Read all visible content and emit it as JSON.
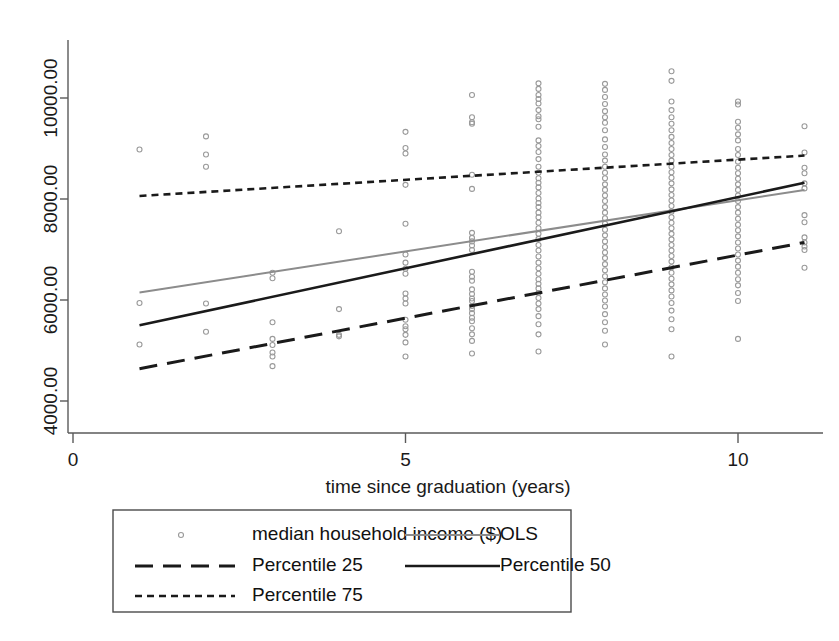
{
  "chart_data": {
    "type": "scatter",
    "title": "",
    "xlabel": "time since graduation (years)",
    "ylabel": "",
    "xlim": [
      0,
      11.6
    ],
    "ylim": [
      3650,
      10650
    ],
    "xticks": [
      0,
      5,
      10
    ],
    "xticklabels": [
      "0",
      "5",
      "10"
    ],
    "yticks": [
      4000,
      6000,
      8000,
      10000
    ],
    "yticklabels": [
      "4000.00",
      "6000.00",
      "8000.00",
      "10000.00"
    ],
    "grid": false,
    "legend_position": "below-axes",
    "marker": {
      "shape": "open-circle",
      "color": "#9a9a9a",
      "size": 5
    },
    "series": [
      {
        "name": "median household income ($)",
        "type": "scatter",
        "color": "#9a9a9a",
        "points": [
          [
            1,
            8980
          ],
          [
            1,
            5940
          ],
          [
            1,
            5120
          ],
          [
            2,
            9240
          ],
          [
            2,
            8880
          ],
          [
            2,
            8640
          ],
          [
            2,
            5930
          ],
          [
            2,
            5370
          ],
          [
            3,
            6540
          ],
          [
            3,
            6430
          ],
          [
            3,
            5560
          ],
          [
            3,
            5230
          ],
          [
            3,
            5110
          ],
          [
            3,
            4960
          ],
          [
            3,
            4880
          ],
          [
            3,
            4690
          ],
          [
            4,
            7360
          ],
          [
            4,
            5820
          ],
          [
            4,
            5310
          ],
          [
            4,
            5280
          ],
          [
            5,
            9330
          ],
          [
            5,
            9010
          ],
          [
            5,
            8900
          ],
          [
            5,
            8280
          ],
          [
            5,
            7510
          ],
          [
            5,
            6900
          ],
          [
            5,
            6740
          ],
          [
            5,
            6620
          ],
          [
            5,
            6520
          ],
          [
            5,
            6130
          ],
          [
            5,
            6030
          ],
          [
            5,
            5930
          ],
          [
            5,
            5610
          ],
          [
            5,
            5480
          ],
          [
            5,
            5420
          ],
          [
            5,
            5310
          ],
          [
            5,
            5160
          ],
          [
            5,
            4880
          ],
          [
            6,
            10060
          ],
          [
            6,
            9620
          ],
          [
            6,
            9520
          ],
          [
            6,
            9490
          ],
          [
            6,
            8480
          ],
          [
            6,
            8200
          ],
          [
            6,
            7330
          ],
          [
            6,
            7230
          ],
          [
            6,
            7160
          ],
          [
            6,
            7080
          ],
          [
            6,
            6990
          ],
          [
            6,
            6560
          ],
          [
            6,
            6460
          ],
          [
            6,
            6380
          ],
          [
            6,
            6210
          ],
          [
            6,
            6120
          ],
          [
            6,
            6030
          ],
          [
            6,
            5980
          ],
          [
            6,
            5880
          ],
          [
            6,
            5820
          ],
          [
            6,
            5740
          ],
          [
            6,
            5650
          ],
          [
            6,
            5580
          ],
          [
            6,
            5440
          ],
          [
            6,
            5320
          ],
          [
            6,
            5190
          ],
          [
            6,
            4940
          ],
          [
            7,
            10290
          ],
          [
            7,
            10180
          ],
          [
            7,
            10060
          ],
          [
            7,
            9980
          ],
          [
            7,
            9890
          ],
          [
            7,
            9760
          ],
          [
            7,
            9640
          ],
          [
            7,
            9580
          ],
          [
            7,
            9430
          ],
          [
            7,
            9160
          ],
          [
            7,
            9050
          ],
          [
            7,
            8930
          ],
          [
            7,
            8790
          ],
          [
            7,
            8640
          ],
          [
            7,
            8520
          ],
          [
            7,
            8410
          ],
          [
            7,
            8320
          ],
          [
            7,
            8230
          ],
          [
            7,
            8120
          ],
          [
            7,
            8010
          ],
          [
            7,
            7920
          ],
          [
            7,
            7840
          ],
          [
            7,
            7730
          ],
          [
            7,
            7640
          ],
          [
            7,
            7530
          ],
          [
            7,
            7420
          ],
          [
            7,
            7310
          ],
          [
            7,
            7210
          ],
          [
            7,
            7090
          ],
          [
            7,
            6980
          ],
          [
            7,
            6860
          ],
          [
            7,
            6740
          ],
          [
            7,
            6630
          ],
          [
            7,
            6520
          ],
          [
            7,
            6410
          ],
          [
            7,
            6320
          ],
          [
            7,
            6230
          ],
          [
            7,
            6140
          ],
          [
            7,
            6040
          ],
          [
            7,
            5930
          ],
          [
            7,
            5820
          ],
          [
            7,
            5680
          ],
          [
            7,
            5520
          ],
          [
            7,
            5320
          ],
          [
            7,
            4980
          ],
          [
            8,
            10280
          ],
          [
            8,
            10160
          ],
          [
            8,
            10020
          ],
          [
            8,
            9880
          ],
          [
            8,
            9740
          ],
          [
            8,
            9620
          ],
          [
            8,
            9510
          ],
          [
            8,
            9360
          ],
          [
            8,
            9180
          ],
          [
            8,
            9030
          ],
          [
            8,
            8880
          ],
          [
            8,
            8760
          ],
          [
            8,
            8640
          ],
          [
            8,
            8520
          ],
          [
            8,
            8410
          ],
          [
            8,
            8290
          ],
          [
            8,
            8180
          ],
          [
            8,
            8070
          ],
          [
            8,
            7960
          ],
          [
            8,
            7840
          ],
          [
            8,
            7730
          ],
          [
            8,
            7620
          ],
          [
            8,
            7510
          ],
          [
            8,
            7390
          ],
          [
            8,
            7280
          ],
          [
            8,
            7160
          ],
          [
            8,
            7050
          ],
          [
            8,
            6940
          ],
          [
            8,
            6830
          ],
          [
            8,
            6710
          ],
          [
            8,
            6590
          ],
          [
            8,
            6470
          ],
          [
            8,
            6350
          ],
          [
            8,
            6230
          ],
          [
            8,
            6110
          ],
          [
            8,
            5990
          ],
          [
            8,
            5870
          ],
          [
            8,
            5720
          ],
          [
            8,
            5560
          ],
          [
            8,
            5390
          ],
          [
            8,
            5120
          ],
          [
            9,
            10530
          ],
          [
            9,
            10340
          ],
          [
            9,
            9930
          ],
          [
            9,
            9760
          ],
          [
            9,
            9620
          ],
          [
            9,
            9490
          ],
          [
            9,
            9360
          ],
          [
            9,
            9230
          ],
          [
            9,
            9110
          ],
          [
            9,
            8990
          ],
          [
            9,
            8870
          ],
          [
            9,
            8760
          ],
          [
            9,
            8640
          ],
          [
            9,
            8530
          ],
          [
            9,
            8420
          ],
          [
            9,
            8310
          ],
          [
            9,
            8190
          ],
          [
            9,
            8080
          ],
          [
            9,
            7970
          ],
          [
            9,
            7860
          ],
          [
            9,
            7750
          ],
          [
            9,
            7640
          ],
          [
            9,
            7530
          ],
          [
            9,
            7420
          ],
          [
            9,
            7310
          ],
          [
            9,
            7200
          ],
          [
            9,
            7090
          ],
          [
            9,
            6980
          ],
          [
            9,
            6870
          ],
          [
            9,
            6760
          ],
          [
            9,
            6650
          ],
          [
            9,
            6540
          ],
          [
            9,
            6420
          ],
          [
            9,
            6310
          ],
          [
            9,
            6190
          ],
          [
            9,
            6070
          ],
          [
            9,
            5940
          ],
          [
            9,
            5790
          ],
          [
            9,
            5620
          ],
          [
            9,
            5420
          ],
          [
            9,
            4880
          ],
          [
            10,
            9930
          ],
          [
            10,
            9870
          ],
          [
            10,
            9530
          ],
          [
            10,
            9410
          ],
          [
            10,
            9280
          ],
          [
            10,
            9160
          ],
          [
            10,
            8990
          ],
          [
            10,
            8870
          ],
          [
            10,
            8740
          ],
          [
            10,
            8620
          ],
          [
            10,
            8510
          ],
          [
            10,
            8400
          ],
          [
            10,
            8290
          ],
          [
            10,
            8180
          ],
          [
            10,
            8070
          ],
          [
            10,
            7960
          ],
          [
            10,
            7840
          ],
          [
            10,
            7730
          ],
          [
            10,
            7610
          ],
          [
            10,
            7490
          ],
          [
            10,
            7380
          ],
          [
            10,
            7260
          ],
          [
            10,
            7140
          ],
          [
            10,
            7020
          ],
          [
            10,
            6900
          ],
          [
            10,
            6780
          ],
          [
            10,
            6660
          ],
          [
            10,
            6540
          ],
          [
            10,
            6410
          ],
          [
            10,
            6290
          ],
          [
            10,
            6140
          ],
          [
            10,
            5980
          ],
          [
            10,
            5230
          ],
          [
            11,
            9440
          ],
          [
            11,
            8920
          ],
          [
            11,
            8620
          ],
          [
            11,
            8510
          ],
          [
            11,
            8310
          ],
          [
            11,
            8210
          ],
          [
            11,
            7680
          ],
          [
            11,
            7540
          ],
          [
            11,
            7240
          ],
          [
            11,
            7140
          ],
          [
            11,
            7060
          ],
          [
            11,
            6990
          ],
          [
            11,
            6640
          ]
        ]
      },
      {
        "name": "OLS",
        "type": "line",
        "style": "solid",
        "color": "#8c8c8c",
        "width": 2.0,
        "x": [
          1,
          11
        ],
        "y": [
          6150,
          8180
        ]
      },
      {
        "name": "Percentile 25",
        "type": "line",
        "style": "dashed-long",
        "color": "#1a1a1a",
        "width": 3.0,
        "x": [
          1,
          11
        ],
        "y": [
          4640,
          7140
        ]
      },
      {
        "name": "Percentile 50",
        "type": "line",
        "style": "solid",
        "color": "#1a1a1a",
        "width": 2.6,
        "x": [
          1,
          11
        ],
        "y": [
          5500,
          8320
        ]
      },
      {
        "name": "Percentile 75",
        "type": "line",
        "style": "dotted-short",
        "color": "#1a1a1a",
        "width": 2.6,
        "x": [
          1,
          11
        ],
        "y": [
          8060,
          8860
        ]
      }
    ],
    "legend_entries": [
      {
        "label": "median household income ($)",
        "kind": "marker",
        "column": 0,
        "row": 0
      },
      {
        "label": "OLS",
        "kind": "line-solid-gray",
        "column": 1,
        "row": 0
      },
      {
        "label": "Percentile 25",
        "kind": "line-dashed-long",
        "column": 0,
        "row": 1
      },
      {
        "label": "Percentile 50",
        "kind": "line-solid-black",
        "column": 1,
        "row": 1
      },
      {
        "label": "Percentile 75",
        "kind": "line-dotted-short",
        "column": 0,
        "row": 2
      }
    ]
  },
  "colors": {
    "background": "#ffffff",
    "axis": "#5a5a5a",
    "marker": "#9a9a9a",
    "ols": "#8c8c8c",
    "percentile": "#1a1a1a",
    "legend_border": "#4a4a4a"
  }
}
